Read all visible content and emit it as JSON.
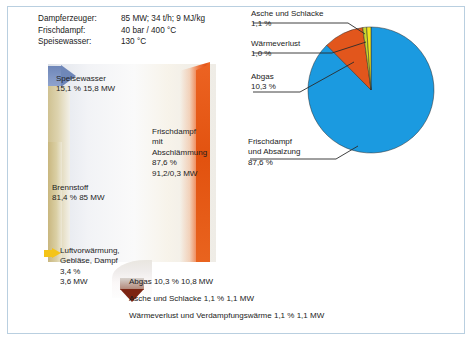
{
  "params": {
    "rows": [
      {
        "key": "Dampferzeuger:",
        "value": "85 MW; 34 t/h; 9 MJ/kg"
      },
      {
        "key": "Frischdampf:",
        "value": "40 bar / 400 °C"
      },
      {
        "key": "Speisewasser:",
        "value": "130 °C"
      }
    ]
  },
  "sankey": {
    "feedwater": "Speisewasser\n15,1 %  15,8 MW",
    "feedwater_l1": "Speisewasser",
    "feedwater_l2": "15,1 %  15,8 MW",
    "steam_l1": "Frischdampf",
    "steam_l2": "mit",
    "steam_l3": "Abschlämmung",
    "steam_l4": "87,6 %",
    "steam_l5": "91,2/0,3 MW",
    "fuel_l1": "Brennstoff",
    "fuel_l2": "81,4 %  85 MW",
    "air_l1": "Luftvorwärmung,",
    "air_l2": "Gebläse, Dampf",
    "air_l3": "3,4 %",
    "air_l4": "3,6 MW"
  },
  "bottom_legend": [
    "Abgas 10,3 %  10,8 MW",
    "Asche und Schlacke 1,1 %  1,1 MW",
    "Wärmeverlust und Verdampfungswärme 1,1 %  1,1 MW"
  ],
  "callouts": {
    "asche_l1": "Asche und Schlacke",
    "asche_l2": "1,1 %",
    "waerme_l1": "Wärmeverlust",
    "waerme_l2": "1,0 %",
    "abgas_l1": "Abgas",
    "abgas_l2": "10,3 %",
    "frisch_l1": "Frischdampf",
    "frisch_l2": "und Absalzung",
    "frisch_l3": "87,6 %"
  },
  "chart_data": {
    "type": "pie",
    "title": "",
    "labels": [
      "Frischdampf und Absalzung",
      "Abgas",
      "Wärmeverlust",
      "Asche und Schlacke"
    ],
    "values": [
      87.6,
      10.3,
      1.0,
      1.1
    ],
    "unit": "%",
    "colors": [
      "#1b9ae0",
      "#e2561c",
      "#c9d62e",
      "#f2e41e"
    ],
    "legend": "callout",
    "start_angle_deg": 0,
    "direction": "clockwise",
    "annotations": [
      "Frischdampf und Absalzung 87,6 %",
      "Abgas 10,3 %",
      "Wärmeverlust 1,0 %",
      "Asche und Schlacke 1,1 %"
    ]
  },
  "colors": {
    "frame_border": "#b9cfe0",
    "blue_slice": "#1b9ae0",
    "orange_slice": "#e2561c",
    "yellow_slice": "#f2e41e",
    "green_slice": "#c9d62e",
    "steam_red": "#e4551a",
    "fuel_tan": "#cfc08d",
    "feed_blue": "#6f87b9"
  }
}
